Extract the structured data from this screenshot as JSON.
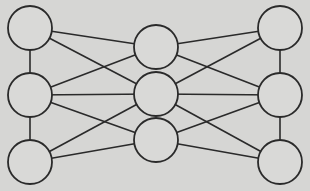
{
  "diagram": {
    "type": "network-graph",
    "background": "#d6d6d4",
    "stroke_color": "#2a2a2a",
    "node_fill": "#d9d9d7",
    "node_radius": 22,
    "nodes": [
      {
        "id": "left-top",
        "x": 30,
        "y": 28
      },
      {
        "id": "left-middle",
        "x": 30,
        "y": 95
      },
      {
        "id": "left-bottom",
        "x": 30,
        "y": 162
      },
      {
        "id": "center-top",
        "x": 156,
        "y": 47
      },
      {
        "id": "center-middle",
        "x": 156,
        "y": 94
      },
      {
        "id": "center-bottom",
        "x": 156,
        "y": 140
      },
      {
        "id": "right-top",
        "x": 280,
        "y": 28
      },
      {
        "id": "right-middle",
        "x": 280,
        "y": 95
      },
      {
        "id": "right-bottom",
        "x": 280,
        "y": 162
      }
    ],
    "edges": [
      [
        "left-top",
        "left-middle"
      ],
      [
        "left-middle",
        "left-bottom"
      ],
      [
        "right-top",
        "right-middle"
      ],
      [
        "right-middle",
        "right-bottom"
      ],
      [
        "left-top",
        "center-top"
      ],
      [
        "left-top",
        "center-middle"
      ],
      [
        "left-middle",
        "center-top"
      ],
      [
        "left-middle",
        "center-middle"
      ],
      [
        "left-middle",
        "center-bottom"
      ],
      [
        "left-bottom",
        "center-middle"
      ],
      [
        "left-bottom",
        "center-bottom"
      ],
      [
        "right-top",
        "center-top"
      ],
      [
        "right-top",
        "center-middle"
      ],
      [
        "right-middle",
        "center-top"
      ],
      [
        "right-middle",
        "center-middle"
      ],
      [
        "right-middle",
        "center-bottom"
      ],
      [
        "right-bottom",
        "center-middle"
      ],
      [
        "right-bottom",
        "center-bottom"
      ]
    ]
  }
}
